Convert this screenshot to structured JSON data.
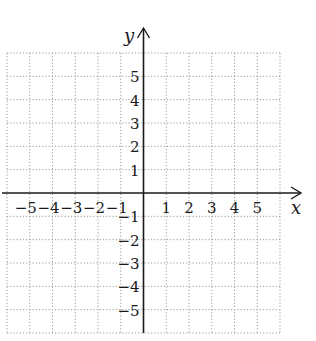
{
  "chart_data": {
    "type": "scatter",
    "title": "",
    "subtitle": "",
    "xlabel": "x",
    "ylabel": "y",
    "xlim": [
      -6,
      6
    ],
    "ylim": [
      -6,
      6
    ],
    "grid": true,
    "grid_style": "dotted",
    "legend": null,
    "x_tick_labels": [
      "-5",
      "-4",
      "-3",
      "-2",
      "-1",
      "1",
      "2",
      "3",
      "4",
      "5"
    ],
    "y_tick_labels": [
      "5",
      "4",
      "3",
      "2",
      "1",
      "-1",
      "-2",
      "-3",
      "-4",
      "-5"
    ],
    "x_ticks": [
      -5,
      -4,
      -3,
      -2,
      -1,
      1,
      2,
      3,
      4,
      5
    ],
    "y_ticks": [
      5,
      4,
      3,
      2,
      1,
      -1,
      -2,
      -3,
      -4,
      -5
    ],
    "series": []
  },
  "labels": {
    "x_axis": "x",
    "y_axis": "y"
  },
  "colors": {
    "axis": "#1a1a1a",
    "grid": "#9a9a9a",
    "background": "#ffffff"
  }
}
